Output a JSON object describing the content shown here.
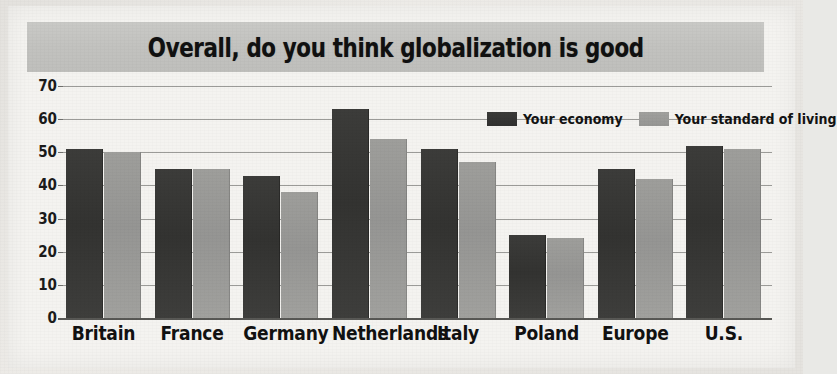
{
  "figure": {
    "title": "Overall, do you think globalization is good",
    "title_band_color": "#c3c3c0",
    "background_color": "#f4f3f0"
  },
  "legend": {
    "position": "top-right-inside",
    "items": [
      {
        "label": "Your economy",
        "key": "economy",
        "color": "#333331",
        "swatch": "legend-swatch-dark"
      },
      {
        "label": "Your standard of living",
        "key": "living",
        "color": "#98989 5",
        "swatch": "legend-swatch-gray"
      }
    ]
  },
  "chart_data": {
    "type": "bar",
    "title": "Overall, do you think globalization is good",
    "xlabel": "",
    "ylabel": "",
    "ylim": [
      0,
      70
    ],
    "yticks": [
      0,
      10,
      20,
      30,
      40,
      50,
      60,
      70
    ],
    "grid": true,
    "grid_axis": "y",
    "categories": [
      "Britain",
      "France",
      "Germany",
      "Netherlands",
      "Italy",
      "Poland",
      "Europe",
      "U.S."
    ],
    "series": [
      {
        "name": "Your economy",
        "color": "#333331",
        "values": [
          51,
          45,
          43,
          63,
          51,
          25,
          45,
          52
        ]
      },
      {
        "name": "Your standard of living",
        "color": "#989895",
        "values": [
          50,
          45,
          38,
          54,
          47,
          24,
          42,
          51
        ]
      }
    ]
  }
}
